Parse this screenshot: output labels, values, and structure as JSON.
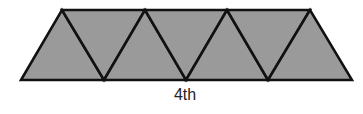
{
  "figure": {
    "label": "4th",
    "fill_color": "#9a9a9a",
    "stroke_color": "#111111",
    "triangle_count": 7,
    "top_vertices": [
      [
        62,
        10
      ],
      [
        145,
        10
      ],
      [
        227,
        10
      ],
      [
        310,
        10
      ]
    ],
    "bottom_vertices": [
      [
        21,
        80
      ],
      [
        104,
        80
      ],
      [
        186,
        80
      ],
      [
        268,
        80
      ],
      [
        352,
        80
      ]
    ]
  }
}
